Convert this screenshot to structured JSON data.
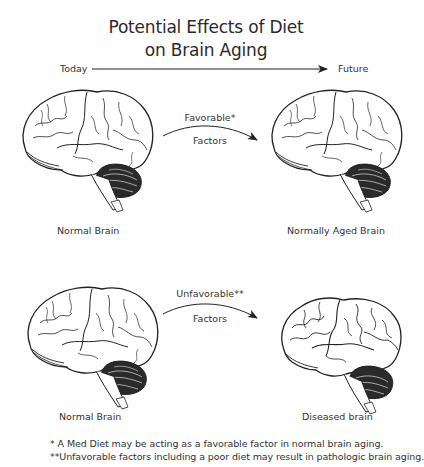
{
  "title": {
    "line1": "Potential Effects of Diet",
    "line2": "on Brain Aging"
  },
  "timeline": {
    "start_label": "Today",
    "end_label": "Future"
  },
  "rows": [
    {
      "left_caption": "Normal Brain",
      "factor_top": "Favorable*",
      "factor_bottom": "Factors",
      "right_caption": "Normally Aged Brain",
      "right_state": "normal-aged"
    },
    {
      "left_caption": "Normal Brain",
      "factor_top": "Unfavorable**",
      "factor_bottom": "Factors",
      "right_caption": "Diseased brain",
      "right_state": "diseased"
    }
  ],
  "footnotes": [
    "* A Med Diet may be acting as a favorable factor in normal brain aging.",
    "**Unfavorable factors including a poor diet may result in pathologic brain aging."
  ],
  "colors": {
    "line": "#222222",
    "text": "#333333",
    "background": "#ffffff"
  }
}
